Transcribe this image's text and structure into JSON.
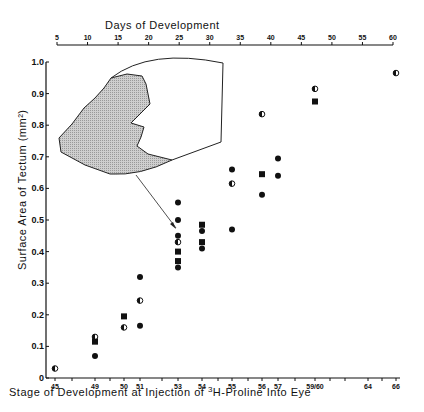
{
  "chart_data": {
    "type": "scatter",
    "title": "",
    "top_axis": {
      "label": "Days of Development",
      "ticks": [
        5,
        10,
        15,
        20,
        25,
        30,
        35,
        40,
        45,
        50,
        55,
        60
      ]
    },
    "xlabel_prefix": "Stage of Development at Injection of ",
    "xlabel_sup": "3",
    "xlabel_suffix": "H-Proline Into Eye",
    "ylabel": "Surface Area of Tectum (mm²)",
    "ylim": [
      0,
      1.0
    ],
    "y_ticks": [
      "0",
      "0.1",
      "0.2",
      "0.3",
      "0.4",
      "0.5",
      "0.6",
      "0.7",
      "0.8",
      "0.9",
      "1.0"
    ],
    "x_ticks": [
      {
        "label": "45",
        "x": 55
      },
      {
        "label": "49",
        "x": 95
      },
      {
        "label": "50",
        "x": 124
      },
      {
        "label": "51",
        "x": 140
      },
      {
        "label": "53",
        "x": 178
      },
      {
        "label": "54",
        "x": 202
      },
      {
        "label": "55",
        "x": 232
      },
      {
        "label": "56",
        "x": 262
      },
      {
        "label": "57",
        "x": 278
      },
      {
        "label": "59/60",
        "x": 315
      },
      {
        "label": "64",
        "x": 368
      },
      {
        "label": "66",
        "x": 396
      }
    ],
    "marker_types": [
      "filled-circle",
      "half-filled-circle",
      "filled-square"
    ],
    "points": [
      {
        "stage": "45",
        "y": 0.03,
        "marker": "half-filled-circle"
      },
      {
        "stage": "49",
        "y": 0.13,
        "marker": "half-filled-circle"
      },
      {
        "stage": "49",
        "y": 0.115,
        "marker": "filled-square"
      },
      {
        "stage": "49",
        "y": 0.07,
        "marker": "filled-circle"
      },
      {
        "stage": "50",
        "y": 0.195,
        "marker": "filled-square"
      },
      {
        "stage": "50",
        "y": 0.16,
        "marker": "half-filled-circle"
      },
      {
        "stage": "51",
        "y": 0.32,
        "marker": "filled-circle"
      },
      {
        "stage": "51",
        "y": 0.245,
        "marker": "half-filled-circle"
      },
      {
        "stage": "51",
        "y": 0.165,
        "marker": "filled-circle"
      },
      {
        "stage": "53",
        "y": 0.555,
        "marker": "filled-circle"
      },
      {
        "stage": "53",
        "y": 0.5,
        "marker": "filled-circle"
      },
      {
        "stage": "53",
        "y": 0.45,
        "marker": "filled-circle"
      },
      {
        "stage": "53",
        "y": 0.43,
        "marker": "half-filled-circle"
      },
      {
        "stage": "53",
        "y": 0.4,
        "marker": "filled-square"
      },
      {
        "stage": "53",
        "y": 0.37,
        "marker": "filled-square"
      },
      {
        "stage": "53",
        "y": 0.35,
        "marker": "filled-circle"
      },
      {
        "stage": "54",
        "y": 0.485,
        "marker": "filled-square"
      },
      {
        "stage": "54",
        "y": 0.465,
        "marker": "filled-circle"
      },
      {
        "stage": "54",
        "y": 0.43,
        "marker": "filled-square"
      },
      {
        "stage": "54",
        "y": 0.41,
        "marker": "filled-circle"
      },
      {
        "stage": "55",
        "y": 0.66,
        "marker": "filled-circle"
      },
      {
        "stage": "55",
        "y": 0.615,
        "marker": "half-filled-circle"
      },
      {
        "stage": "55",
        "y": 0.47,
        "marker": "filled-circle"
      },
      {
        "stage": "56",
        "y": 0.835,
        "marker": "half-filled-circle"
      },
      {
        "stage": "56",
        "y": 0.645,
        "marker": "filled-square"
      },
      {
        "stage": "56",
        "y": 0.58,
        "marker": "filled-circle"
      },
      {
        "stage": "57",
        "y": 0.695,
        "marker": "filled-circle"
      },
      {
        "stage": "57",
        "y": 0.64,
        "marker": "filled-circle"
      },
      {
        "stage": "59/60",
        "y": 0.915,
        "marker": "half-filled-circle"
      },
      {
        "stage": "59/60",
        "y": 0.875,
        "marker": "filled-square"
      },
      {
        "stage": "66",
        "y": 0.965,
        "marker": "half-filled-circle"
      }
    ],
    "annotation": "inset drawing of tectum outline with shaded region; arrow points to stage 53 data point",
    "grid": false,
    "legend": null
  }
}
